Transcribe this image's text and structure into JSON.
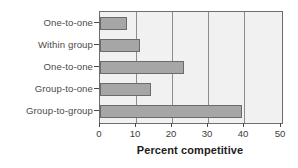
{
  "chart_data": {
    "type": "bar",
    "orientation": "horizontal",
    "title": "",
    "xlabel": "Percent competitive",
    "ylabel": "",
    "categories": [
      "One-to-one",
      "Within group",
      "One-to-one",
      "Group-to-one",
      "Group-to-group"
    ],
    "values": [
      7.5,
      11,
      23,
      14,
      39
    ],
    "xlim": [
      0,
      50
    ],
    "xticks": [
      0,
      10,
      20,
      30,
      40,
      50
    ],
    "xtick_labels": [
      "0",
      "10",
      "20",
      "30",
      "40",
      "50"
    ],
    "grid": "vertical",
    "legend": "none",
    "colors": {
      "bar_fill": "#a6a6a6",
      "bar_edge": "#6b6b6b",
      "plot_background": "#f1f1f1",
      "gridline": "#8c8c8c",
      "axis": "#6e6e6e",
      "figure_background": "#ffffff",
      "label_text": "#4b4b4b",
      "title_text": "#1d1d1d"
    }
  }
}
